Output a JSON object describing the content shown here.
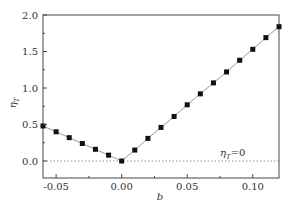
{
  "chart_data": {
    "type": "line",
    "title": "",
    "xlabel": "b",
    "ylabel": "η_T",
    "xlim": [
      -0.06,
      0.12
    ],
    "ylim": [
      -0.23,
      2.0
    ],
    "xticks": [
      -0.05,
      0.0,
      0.05,
      0.1
    ],
    "xtick_labels": [
      "-0.05",
      "0.00",
      "0.05",
      "0.10"
    ],
    "yticks": [
      0.0,
      0.5,
      1.0,
      1.5,
      2.0
    ],
    "ytick_labels": [
      "0.0",
      "0.5",
      "1.0",
      "1.5",
      "2.0"
    ],
    "grid": false,
    "series": [
      {
        "name": "η_T",
        "marker": "square",
        "color": "#111111",
        "line_color": "#999999",
        "x": [
          -0.06,
          -0.05,
          -0.04,
          -0.03,
          -0.02,
          -0.01,
          0.0,
          0.01,
          0.02,
          0.03,
          0.04,
          0.05,
          0.06,
          0.07,
          0.08,
          0.09,
          0.1,
          0.11,
          0.12
        ],
        "values": [
          0.48,
          0.4,
          0.32,
          0.24,
          0.16,
          0.08,
          0.0,
          0.15,
          0.31,
          0.46,
          0.61,
          0.77,
          0.92,
          1.07,
          1.22,
          1.38,
          1.53,
          1.69,
          1.84
        ]
      }
    ],
    "reference_line": {
      "y": 0.0,
      "style": "dotted",
      "label": "η_T=0"
    },
    "annotations": [
      {
        "text": "η_T=0",
        "x": 0.085,
        "y": 0.06
      }
    ]
  },
  "labels": {
    "xlabel": "b",
    "ylabel_main": "η",
    "ylabel_sub": "T",
    "annotation_main": "η",
    "annotation_sub": "T",
    "annotation_rest": "=0"
  }
}
